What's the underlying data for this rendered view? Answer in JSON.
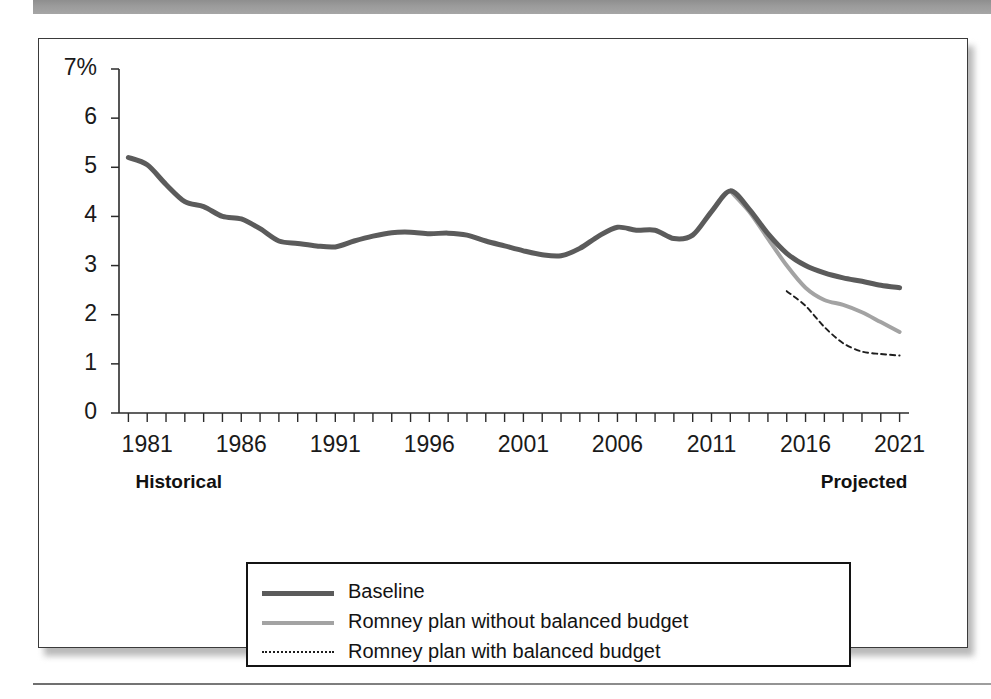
{
  "figure": {
    "historical_label": "Historical",
    "projected_label": "Projected"
  },
  "legend": {
    "items": [
      {
        "label": "Baseline",
        "style": "solid-thick",
        "color": "#5b5b5b"
      },
      {
        "label": "Romney plan without balanced budget",
        "style": "solid-medium",
        "color": "#a3a3a3"
      },
      {
        "label": "Romney plan with balanced budget",
        "style": "dotted-thin",
        "color": "#1e1e1e"
      }
    ]
  },
  "chart_data": {
    "type": "line",
    "title": "",
    "xlabel": "",
    "ylabel": "",
    "ylim": [
      0,
      7
    ],
    "xlim": [
      1979.5,
      2021.5
    ],
    "grid": false,
    "legend_position": "bottom-center",
    "y_unit": "%",
    "ytick_labels": [
      "7%",
      "6",
      "5",
      "4",
      "3",
      "2",
      "1",
      "0"
    ],
    "ytick_values": [
      7,
      6,
      5,
      4,
      3,
      2,
      1,
      0
    ],
    "xtick_labels": [
      "1981",
      "1986",
      "1991",
      "1996",
      "2001",
      "2006",
      "2011",
      "2016",
      "2021"
    ],
    "xtick_values": [
      1981,
      1986,
      1991,
      1996,
      2001,
      2006,
      2011,
      2016,
      2021
    ],
    "xtick_minor_step": 1,
    "annotations": [
      {
        "text": "Historical",
        "x": 1982.5,
        "position": "below-axis-left"
      },
      {
        "text": "Projected",
        "x": 2020.0,
        "position": "below-axis-right"
      }
    ],
    "series": [
      {
        "name": "Baseline",
        "color": "#5b5b5b",
        "style": "solid-thick",
        "x": [
          1980,
          1981,
          1982,
          1983,
          1984,
          1985,
          1986,
          1987,
          1988,
          1989,
          1990,
          1991,
          1992,
          1993,
          1994,
          1995,
          1996,
          1997,
          1998,
          1999,
          2000,
          2001,
          2002,
          2003,
          2004,
          2005,
          2006,
          2007,
          2008,
          2009,
          2010,
          2011,
          2012,
          2013,
          2014,
          2015,
          2016,
          2017,
          2018,
          2019,
          2020,
          2021
        ],
        "values": [
          5.2,
          5.05,
          4.65,
          4.3,
          4.2,
          4.0,
          3.95,
          3.75,
          3.5,
          3.45,
          3.4,
          3.38,
          3.5,
          3.6,
          3.67,
          3.68,
          3.65,
          3.66,
          3.62,
          3.5,
          3.4,
          3.3,
          3.22,
          3.2,
          3.35,
          3.6,
          3.78,
          3.72,
          3.72,
          3.55,
          3.62,
          4.1,
          4.52,
          4.15,
          3.65,
          3.25,
          3.0,
          2.85,
          2.75,
          2.68,
          2.6,
          2.55
        ]
      },
      {
        "name": "Romney plan without balanced budget",
        "color": "#a3a3a3",
        "style": "solid-medium",
        "x": [
          2012,
          2013,
          2014,
          2015,
          2016,
          2017,
          2018,
          2019,
          2020,
          2021
        ],
        "values": [
          4.52,
          4.1,
          3.55,
          3.0,
          2.55,
          2.3,
          2.2,
          2.05,
          1.85,
          1.65
        ]
      },
      {
        "name": "Romney plan with balanced budget",
        "color": "#1e1e1e",
        "style": "dotted-thin",
        "x": [
          2015,
          2016,
          2017,
          2018,
          2019,
          2020,
          2021
        ],
        "values": [
          2.48,
          2.18,
          1.75,
          1.42,
          1.25,
          1.2,
          1.17
        ]
      }
    ]
  }
}
